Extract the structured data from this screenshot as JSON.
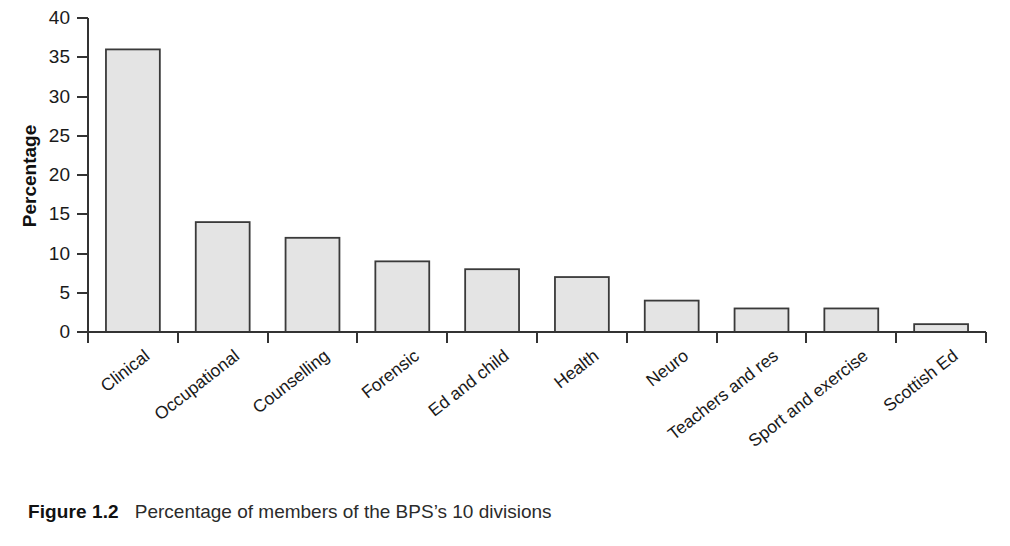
{
  "figure": {
    "caption_label": "Figure 1.2",
    "caption_text": "Percentage of members of the BPS’s 10 divisions"
  },
  "chart_data": {
    "type": "bar",
    "title": "",
    "xlabel": "",
    "ylabel": "Percentage",
    "ylim": [
      0,
      40
    ],
    "ytick_step": 5,
    "yticks": [
      0,
      5,
      10,
      15,
      20,
      25,
      30,
      35,
      40
    ],
    "ytick_labels": [
      "0",
      "5",
      "10",
      "15",
      "20",
      "25",
      "30",
      "35",
      "40"
    ],
    "grid": false,
    "legend": false,
    "legend_position": "none",
    "xtick_rotation_deg": -38,
    "categories": [
      "Clinical",
      "Occupational",
      "Counselling",
      "Forensic",
      "Ed and child",
      "Health",
      "Neuro",
      "Teachers and res",
      "Sport and exercise",
      "Scottish Ed"
    ],
    "values": [
      36,
      14,
      12,
      9,
      8,
      7,
      4,
      3,
      3,
      1
    ],
    "bar_fill_color": "#e4e4e4",
    "bar_edge_color": "#3a3a3a",
    "axis_color": "#333333"
  }
}
